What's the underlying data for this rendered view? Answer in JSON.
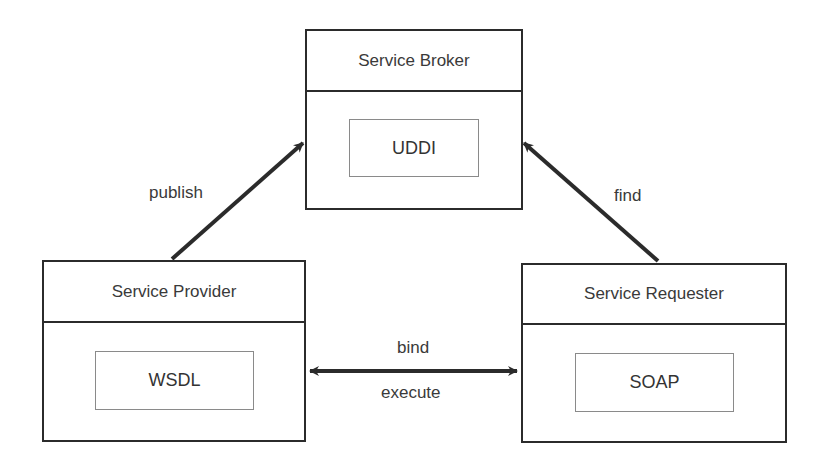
{
  "nodes": {
    "broker": {
      "title": "Service Broker",
      "component": "UDDI"
    },
    "provider": {
      "title": "Service Provider",
      "component": "WSDL"
    },
    "requester": {
      "title": "Service Requester",
      "component": "SOAP"
    }
  },
  "edges": {
    "publish": {
      "label": "publish",
      "from": "provider",
      "to": "broker"
    },
    "find": {
      "label": "find",
      "from": "requester",
      "to": "broker"
    },
    "bind": {
      "label_top": "bind",
      "label_bottom": "execute",
      "between": [
        "provider",
        "requester"
      ]
    }
  },
  "colors": {
    "line": "#2b2b2b",
    "text": "#3a3a3a",
    "inner_border": "#8a8a8a"
  }
}
